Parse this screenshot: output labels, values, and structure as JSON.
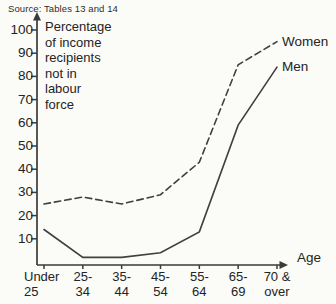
{
  "source_note": "Source: Tables 13 and 14",
  "chart_data": {
    "type": "line",
    "title": "Percentage of income recipients not in labour force",
    "ylabel_multiline": "Percentage\nof income\nrecipients\nnot in\nlabour\nforce",
    "xlabel": "Age",
    "categories": [
      "Under 25",
      "25-34",
      "35-44",
      "45-54",
      "55-64",
      "65-69",
      "70 & over"
    ],
    "category_labels_two_line": [
      "Under\n25",
      "25-\n34",
      "35-\n44",
      "45-\n54",
      "55-\n64",
      "65-\n69",
      "70 &\nover"
    ],
    "yticks": [
      10,
      20,
      30,
      40,
      50,
      60,
      70,
      80,
      90,
      100
    ],
    "ylim": [
      0,
      100
    ],
    "grid": false,
    "legend_position": "right of line ends",
    "series": [
      {
        "name": "Women",
        "line_style": "dashed",
        "values": [
          25,
          28,
          25,
          29,
          43,
          85,
          95
        ]
      },
      {
        "name": "Men",
        "line_style": "solid",
        "values": [
          14,
          2,
          2,
          4,
          13,
          59,
          84
        ]
      }
    ]
  },
  "colors": {
    "background": "#fbfbf8",
    "ink": "#242424",
    "line": "#404040"
  }
}
